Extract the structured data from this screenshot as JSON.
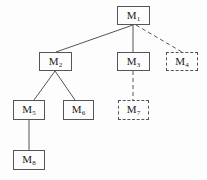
{
  "diagram": {
    "type": "tree",
    "nodes": [
      {
        "id": "M1",
        "label": "M",
        "sub": "1",
        "style": "solid",
        "x": 117,
        "y": 6,
        "w": 33,
        "h": 19
      },
      {
        "id": "M2",
        "label": "M",
        "sub": "2",
        "style": "solid",
        "x": 39,
        "y": 52,
        "w": 33,
        "h": 19
      },
      {
        "id": "M3",
        "label": "M",
        "sub": "3",
        "style": "solid",
        "x": 117,
        "y": 52,
        "w": 33,
        "h": 19
      },
      {
        "id": "M4",
        "label": "M",
        "sub": "4",
        "style": "dashed",
        "x": 166,
        "y": 52,
        "w": 32,
        "h": 19
      },
      {
        "id": "M5",
        "label": "M",
        "sub": "5",
        "style": "solid",
        "x": 13,
        "y": 100,
        "w": 32,
        "h": 20
      },
      {
        "id": "M6",
        "label": "M",
        "sub": "6",
        "style": "solid",
        "x": 63,
        "y": 100,
        "w": 31,
        "h": 20
      },
      {
        "id": "M7",
        "label": "M",
        "sub": "7",
        "style": "dashed",
        "x": 118,
        "y": 100,
        "w": 31,
        "h": 20
      },
      {
        "id": "M8",
        "label": "M",
        "sub": "8",
        "style": "solid",
        "x": 13,
        "y": 150,
        "w": 32,
        "h": 20
      }
    ],
    "edges": [
      {
        "from": "M1",
        "to": "M2",
        "style": "solid"
      },
      {
        "from": "M1",
        "to": "M3",
        "style": "solid"
      },
      {
        "from": "M1",
        "to": "M4",
        "style": "dashed"
      },
      {
        "from": "M2",
        "to": "M5",
        "style": "solid"
      },
      {
        "from": "M2",
        "to": "M6",
        "style": "solid"
      },
      {
        "from": "M3",
        "to": "M7",
        "style": "dashed"
      },
      {
        "from": "M5",
        "to": "M8",
        "style": "solid"
      }
    ]
  }
}
